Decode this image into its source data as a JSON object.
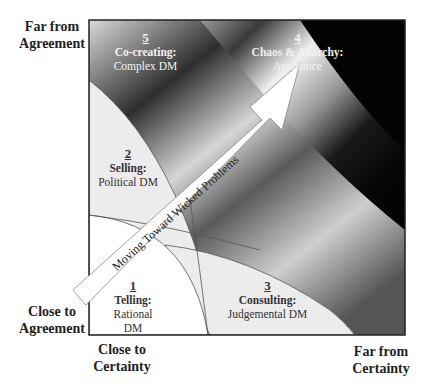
{
  "diagram": {
    "title": "",
    "y_axis": {
      "top_label": "Far from Agreement",
      "top_lines": [
        "Far from",
        "Agreement"
      ],
      "bottom_lines": [
        "Close to",
        "Agreement"
      ]
    },
    "x_axis": {
      "left_lines": [
        "Close to",
        "Certainty"
      ],
      "right_lines": [
        "Far from",
        "Certainty"
      ]
    },
    "regions": [
      {
        "number": "1",
        "title": "Telling:",
        "subtitle": "Rational DM"
      },
      {
        "number": "2",
        "title": "Selling:",
        "subtitle": "Political DM"
      },
      {
        "number": "3",
        "title": "Consulting:",
        "subtitle": "Judgemental DM"
      },
      {
        "number": "4",
        "title": "Chaos & Anarchy:",
        "subtitle": "Avoidance"
      },
      {
        "number": "5",
        "title": "Co-creating:",
        "subtitle": "Complex DM"
      }
    ],
    "arrow": {
      "label": "Moving Toward Wicked Problems"
    },
    "colors": {
      "frame": "#222222",
      "light_region": "#ececec",
      "white_region": "#ffffff",
      "dark": "#050505"
    }
  }
}
